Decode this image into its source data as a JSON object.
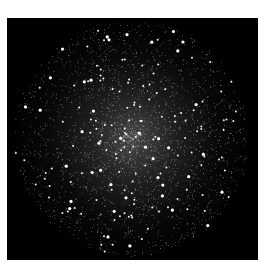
{
  "image": {
    "subject": "globular star cluster",
    "background_color": "#000000",
    "page_background": "#ffffff",
    "frame": {
      "x": 7,
      "y": 18,
      "width": 251,
      "height": 242
    },
    "cluster": {
      "center_x": 125,
      "center_y": 121,
      "radius": 118,
      "star_color": "#ffffff"
    }
  }
}
